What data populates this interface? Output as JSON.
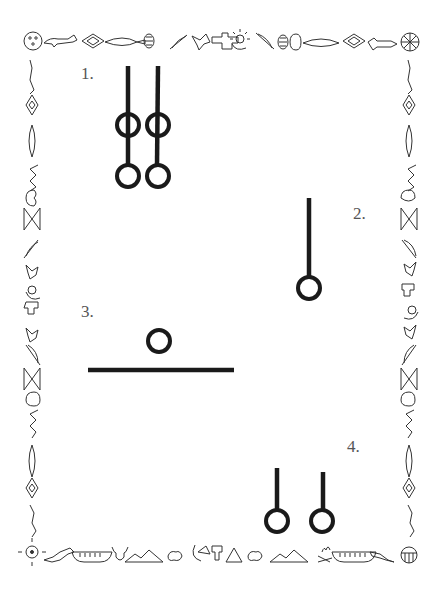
{
  "page": {
    "background": "#ffffff",
    "ink_color": "#1a1a1a",
    "label_color": "#555555",
    "border_color": "#333333"
  },
  "border": {
    "style": "native-american-pictograph-frame",
    "top_icons": [
      "dreamcatcher-icon",
      "fish-icon",
      "animal-icon",
      "diamond-icon",
      "feather-pod-icon",
      "corn-icon",
      "feather-icon",
      "bird-icon",
      "thunderbird-icon",
      "sun-moon-icon",
      "feather-icon",
      "corn-icon",
      "feather-pod-icon",
      "diamond-icon",
      "animal-icon",
      "wheel-icon"
    ],
    "bottom_icons": [
      "sun-symbol-icon",
      "horse-icon",
      "canoe-icon",
      "bison-head-icon",
      "mountains-icon",
      "stones-icon",
      "moon-sun-icon",
      "thunderbird-icon",
      "tipi-icon",
      "stones-icon",
      "mountains-icon",
      "campfire-icon",
      "canoe-icon",
      "horse-icon",
      "drum-icon"
    ],
    "side_icons": [
      "lizard-icon",
      "diamond-icon",
      "feather-pod-icon",
      "snake-icon",
      "fish-head-icon",
      "woven-pattern-icon",
      "feather-icon",
      "bird-icon",
      "sun-moon-icon",
      "thunderbird-icon"
    ]
  },
  "figures": [
    {
      "label": "1.",
      "description": "Two sticks, each with a loop on the stick and a hanging ring"
    },
    {
      "label": "2.",
      "description": "One stick with a hanging ring"
    },
    {
      "label": "3.",
      "description": "A ring above a horizontal bar"
    },
    {
      "label": "4.",
      "description": "Two sticks each with a hanging ring"
    }
  ]
}
